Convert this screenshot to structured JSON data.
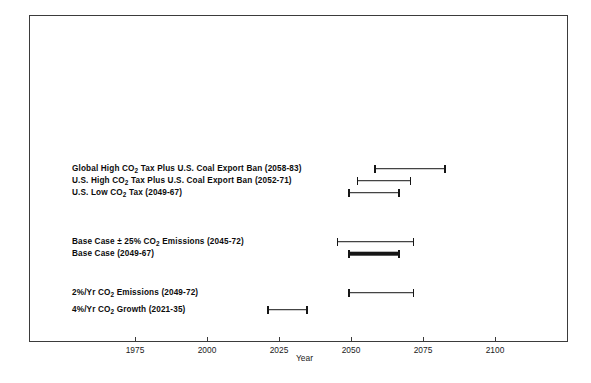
{
  "chart_data": {
    "type": "bar",
    "subtype": "range-interval",
    "title": "",
    "xlabel": "Year",
    "ylabel": "",
    "xlim": [
      1962,
      2115
    ],
    "grid": false,
    "legend": null,
    "xticks": [
      1975,
      2000,
      2025,
      2050,
      2075,
      2100
    ],
    "xtick_labels": [
      "1975",
      "2000",
      "2025",
      "2050",
      "2075",
      "2100"
    ],
    "categories": [
      "Global High CO2 Tax Plus U.S. Coal Export Ban (2058-83)",
      "U.S. High CO2 Tax Plus U.S. Coal Export Ban (2052-71)",
      "U.S. Low CO2 Tax (2049-67)",
      "Base Case ± 25% CO2 Emissions (2045-72)",
      "Base Case (2049-67)",
      "2%/Yr CO2 Emissions (2049-72)",
      "4%/Yr CO2 Growth (2021-35)"
    ],
    "series": [
      {
        "name": "Scenario interval",
        "intervals": [
          {
            "label": "Global High CO2 Tax Plus U.S. Coal Export Ban",
            "start": 2058,
            "end": 2083,
            "style": "thin"
          },
          {
            "label": "U.S. High CO2 Tax Plus U.S. Coal Export Ban",
            "start": 2052,
            "end": 2071,
            "style": "thin"
          },
          {
            "label": "U.S. Low CO2 Tax",
            "start": 2049,
            "end": 2067,
            "style": "thin"
          },
          {
            "label": "Base Case ± 25% CO2 Emissions",
            "start": 2045,
            "end": 2072,
            "style": "thin"
          },
          {
            "label": "Base Case",
            "start": 2049,
            "end": 2067,
            "style": "thick"
          },
          {
            "label": "2%/Yr CO2 Emissions",
            "start": 2049,
            "end": 2072,
            "style": "thin"
          },
          {
            "label": "4%/Yr CO2 Growth",
            "start": 2021,
            "end": 2035,
            "style": "thin"
          }
        ]
      }
    ]
  },
  "axis": {
    "title": "Year",
    "ticks": [
      {
        "value": 1975,
        "label": "1975"
      },
      {
        "value": 2000,
        "label": "2000"
      },
      {
        "value": 2025,
        "label": "2025"
      },
      {
        "value": 2050,
        "label": "2050"
      },
      {
        "value": 2075,
        "label": "2075"
      },
      {
        "value": 2100,
        "label": "2100"
      }
    ]
  },
  "rows": [
    {
      "id": "global-high-co2-tax-coal-export-ban",
      "label_pre": "Global High CO",
      "label_sub": "2",
      "label_post": " Tax Plus U.S. Coal Export Ban (2058-83)",
      "start": 2058,
      "end": 2083,
      "style": "thin"
    },
    {
      "id": "us-high-co2-tax-coal-export-ban",
      "label_pre": "U.S. High CO",
      "label_sub": "2",
      "label_post": " Tax Plus U.S. Coal Export Ban (2052-71)",
      "start": 2052,
      "end": 2071,
      "style": "thin"
    },
    {
      "id": "us-low-co2-tax",
      "label_pre": "U.S. Low CO",
      "label_sub": "2",
      "label_post": " Tax (2049-67)",
      "start": 2049,
      "end": 2067,
      "style": "thin"
    },
    {
      "id": "base-case-plus-minus-25pct",
      "label_pre": "Base Case ± 25% CO",
      "label_sub": "2",
      "label_post": " Emissions (2045-72)",
      "start": 2045,
      "end": 2072,
      "style": "thin"
    },
    {
      "id": "base-case",
      "label_pre": "Base Case (2049-67)",
      "label_sub": "",
      "label_post": "",
      "start": 2049,
      "end": 2067,
      "style": "thick"
    },
    {
      "id": "2pct-yr-co2-emissions",
      "label_pre": "2%/Yr CO",
      "label_sub": "2",
      "label_post": " Emissions (2049-72)",
      "start": 2049,
      "end": 2072,
      "style": "thin"
    },
    {
      "id": "4pct-yr-co2-growth",
      "label_pre": "4%/Yr CO",
      "label_sub": "2",
      "label_post": " Growth (2021-35)",
      "start": 2021,
      "end": 2035,
      "style": "thin"
    }
  ],
  "colors": {
    "bar": "#161616",
    "frame": "#3b3b3b",
    "text": "#0c0c0c",
    "background": "#ffffff"
  }
}
